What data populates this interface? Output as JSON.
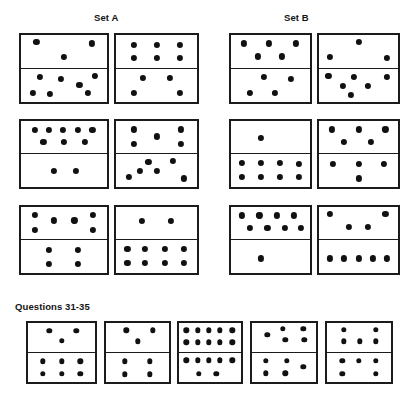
{
  "labels": {
    "set_a": "Set A",
    "set_b": "Set B",
    "questions": "Questions 31-35"
  },
  "style": {
    "pip_color": "#111111",
    "border_color": "#1b1b1b",
    "tile_fill": "#ffffff",
    "text_color": "#141414"
  },
  "puzzle_type": "domino-sequence",
  "dominoes": [
    {
      "id": "A1",
      "group": "Set A",
      "row": 1,
      "col": 1,
      "x": 19,
      "y": 33,
      "w": 90,
      "h": 71,
      "top_count": 3,
      "bottom_count": 7,
      "top_pips": [
        [
          18,
          22
        ],
        [
          82,
          26
        ],
        [
          50,
          68
        ]
      ],
      "bottom_pips": [
        [
          22,
          24
        ],
        [
          46,
          32
        ],
        [
          68,
          50
        ],
        [
          86,
          22
        ],
        [
          14,
          72
        ],
        [
          34,
          76
        ],
        [
          78,
          74
        ]
      ]
    },
    {
      "id": "A2",
      "group": "Set A",
      "row": 1,
      "col": 2,
      "x": 114,
      "y": 33,
      "w": 85,
      "h": 71,
      "top_count": 6,
      "bottom_count": 4,
      "top_pips": [
        [
          22,
          30
        ],
        [
          50,
          30
        ],
        [
          79,
          30
        ],
        [
          22,
          70
        ],
        [
          50,
          70
        ],
        [
          79,
          70
        ]
      ],
      "bottom_pips": [
        [
          33,
          28
        ],
        [
          67,
          28
        ],
        [
          22,
          72
        ],
        [
          79,
          72
        ]
      ]
    },
    {
      "id": "A3",
      "group": "Set A",
      "row": 2,
      "col": 1,
      "x": 19,
      "y": 119,
      "w": 90,
      "h": 70,
      "top_count": 8,
      "bottom_count": 2,
      "top_pips": [
        [
          16,
          28
        ],
        [
          32,
          28
        ],
        [
          49,
          28
        ],
        [
          66,
          28
        ],
        [
          83,
          28
        ],
        [
          26,
          66
        ],
        [
          50,
          66
        ],
        [
          74,
          66
        ]
      ],
      "bottom_pips": [
        [
          38,
          50
        ],
        [
          64,
          50
        ]
      ]
    },
    {
      "id": "A4",
      "group": "Set A",
      "row": 2,
      "col": 2,
      "x": 114,
      "y": 119,
      "w": 85,
      "h": 70,
      "top_count": 5,
      "bottom_count": 6,
      "top_pips": [
        [
          22,
          26
        ],
        [
          80,
          26
        ],
        [
          50,
          48
        ],
        [
          22,
          72
        ],
        [
          80,
          72
        ]
      ],
      "bottom_pips": [
        [
          40,
          24
        ],
        [
          70,
          22
        ],
        [
          16,
          70
        ],
        [
          50,
          52
        ],
        [
          84,
          74
        ],
        [
          30,
          52
        ]
      ]
    },
    {
      "id": "A5",
      "group": "Set A",
      "row": 3,
      "col": 1,
      "x": 19,
      "y": 205,
      "w": 90,
      "h": 70,
      "top_count": 6,
      "bottom_count": 4,
      "top_pips": [
        [
          16,
          24
        ],
        [
          38,
          42
        ],
        [
          62,
          42
        ],
        [
          84,
          24
        ],
        [
          16,
          72
        ],
        [
          84,
          72
        ]
      ],
      "bottom_pips": [
        [
          32,
          30
        ],
        [
          66,
          30
        ],
        [
          32,
          72
        ],
        [
          66,
          72
        ]
      ]
    },
    {
      "id": "A6",
      "group": "Set A",
      "row": 3,
      "col": 2,
      "x": 114,
      "y": 205,
      "w": 85,
      "h": 70,
      "top_count": 2,
      "bottom_count": 8,
      "top_pips": [
        [
          32,
          44
        ],
        [
          68,
          44
        ]
      ],
      "bottom_pips": [
        [
          14,
          28
        ],
        [
          36,
          28
        ],
        [
          60,
          28
        ],
        [
          84,
          28
        ],
        [
          14,
          70
        ],
        [
          36,
          70
        ],
        [
          60,
          70
        ],
        [
          84,
          70
        ]
      ]
    },
    {
      "id": "B1",
      "group": "Set B",
      "row": 1,
      "col": 1,
      "x": 229,
      "y": 33,
      "w": 83,
      "h": 71,
      "top_count": 5,
      "bottom_count": 4,
      "top_pips": [
        [
          16,
          26
        ],
        [
          48,
          26
        ],
        [
          82,
          26
        ],
        [
          34,
          66
        ],
        [
          64,
          66
        ]
      ],
      "bottom_pips": [
        [
          42,
          26
        ],
        [
          76,
          30
        ],
        [
          24,
          72
        ],
        [
          56,
          74
        ]
      ]
    },
    {
      "id": "B2",
      "group": "Set B",
      "row": 1,
      "col": 2,
      "x": 317,
      "y": 33,
      "w": 83,
      "h": 71,
      "top_count": 3,
      "bottom_count": 6,
      "top_pips": [
        [
          50,
          22
        ],
        [
          14,
          68
        ],
        [
          86,
          70
        ]
      ],
      "bottom_pips": [
        [
          12,
          22
        ],
        [
          44,
          26
        ],
        [
          86,
          24
        ],
        [
          30,
          52
        ],
        [
          62,
          52
        ],
        [
          40,
          78
        ]
      ]
    },
    {
      "id": "B3",
      "group": "Set B",
      "row": 2,
      "col": 1,
      "x": 229,
      "y": 119,
      "w": 83,
      "h": 70,
      "top_count": 1,
      "bottom_count": 8,
      "top_pips": [
        [
          38,
          52
        ]
      ],
      "bottom_pips": [
        [
          14,
          28
        ],
        [
          38,
          28
        ],
        [
          62,
          28
        ],
        [
          86,
          30
        ],
        [
          14,
          70
        ],
        [
          38,
          70
        ],
        [
          62,
          70
        ],
        [
          86,
          70
        ]
      ]
    },
    {
      "id": "B4",
      "group": "Set B",
      "row": 2,
      "col": 2,
      "x": 317,
      "y": 119,
      "w": 83,
      "h": 70,
      "top_count": 5,
      "bottom_count": 4,
      "top_pips": [
        [
          16,
          26
        ],
        [
          50,
          26
        ],
        [
          84,
          26
        ],
        [
          32,
          66
        ],
        [
          66,
          66
        ]
      ],
      "bottom_pips": [
        [
          18,
          30
        ],
        [
          50,
          30
        ],
        [
          82,
          30
        ],
        [
          50,
          74
        ]
      ]
    },
    {
      "id": "B5",
      "group": "Set B",
      "row": 3,
      "col": 1,
      "x": 229,
      "y": 205,
      "w": 83,
      "h": 70,
      "top_count": 8,
      "bottom_count": 1,
      "top_pips": [
        [
          14,
          26
        ],
        [
          36,
          26
        ],
        [
          58,
          26
        ],
        [
          80,
          26
        ],
        [
          24,
          66
        ],
        [
          46,
          66
        ],
        [
          68,
          66
        ],
        [
          88,
          66
        ]
      ],
      "bottom_pips": [
        [
          38,
          56
        ]
      ]
    },
    {
      "id": "B6",
      "group": "Set B",
      "row": 3,
      "col": 2,
      "x": 317,
      "y": 205,
      "w": 83,
      "h": 70,
      "top_count": 4,
      "bottom_count": 5,
      "top_pips": [
        [
          14,
          22
        ],
        [
          84,
          22
        ],
        [
          38,
          62
        ],
        [
          62,
          62
        ]
      ],
      "bottom_pips": [
        [
          14,
          56
        ],
        [
          32,
          56
        ],
        [
          50,
          56
        ],
        [
          68,
          56
        ],
        [
          86,
          56
        ]
      ]
    }
  ],
  "question_dominoes": [
    {
      "id": "Q31",
      "index": 31,
      "x": 26,
      "y": 321,
      "w": 71,
      "h": 63,
      "top_count": 3,
      "bottom_count": 6,
      "top_pips": [
        [
          32,
          28
        ],
        [
          72,
          28
        ],
        [
          50,
          62
        ]
      ],
      "bottom_pips": [
        [
          22,
          30
        ],
        [
          50,
          30
        ],
        [
          78,
          30
        ],
        [
          22,
          72
        ],
        [
          50,
          72
        ],
        [
          78,
          72
        ]
      ]
    },
    {
      "id": "Q32",
      "index": 32,
      "x": 104,
      "y": 321,
      "w": 67,
      "h": 63,
      "top_count": 3,
      "bottom_count": 4,
      "top_pips": [
        [
          32,
          26
        ],
        [
          74,
          26
        ],
        [
          50,
          64
        ]
      ],
      "bottom_pips": [
        [
          30,
          30
        ],
        [
          70,
          30
        ],
        [
          30,
          74
        ],
        [
          70,
          74
        ]
      ]
    },
    {
      "id": "Q33",
      "index": 33,
      "x": 177,
      "y": 321,
      "w": 66,
      "h": 63,
      "top_count": 10,
      "bottom_count": 7,
      "top_pips": [
        [
          12,
          26
        ],
        [
          30,
          26
        ],
        [
          48,
          26
        ],
        [
          66,
          26
        ],
        [
          86,
          26
        ],
        [
          12,
          68
        ],
        [
          30,
          68
        ],
        [
          48,
          68
        ],
        [
          66,
          68
        ],
        [
          86,
          68
        ]
      ],
      "bottom_pips": [
        [
          12,
          26
        ],
        [
          30,
          26
        ],
        [
          48,
          26
        ],
        [
          66,
          26
        ],
        [
          86,
          26
        ],
        [
          32,
          72
        ],
        [
          60,
          72
        ]
      ]
    },
    {
      "id": "Q34",
      "index": 34,
      "x": 250,
      "y": 321,
      "w": 68,
      "h": 63,
      "top_count": 5,
      "bottom_count": 5,
      "top_pips": [
        [
          48,
          20
        ],
        [
          80,
          20
        ],
        [
          24,
          42
        ],
        [
          52,
          58
        ],
        [
          82,
          60
        ]
      ],
      "bottom_pips": [
        [
          22,
          28
        ],
        [
          54,
          28
        ],
        [
          80,
          48
        ],
        [
          22,
          70
        ],
        [
          52,
          70
        ]
      ]
    },
    {
      "id": "Q35",
      "index": 35,
      "x": 325,
      "y": 321,
      "w": 68,
      "h": 63,
      "top_count": 5,
      "bottom_count": 5,
      "top_pips": [
        [
          26,
          24
        ],
        [
          76,
          24
        ],
        [
          26,
          64
        ],
        [
          51,
          64
        ],
        [
          76,
          64
        ]
      ],
      "bottom_pips": [
        [
          24,
          28
        ],
        [
          50,
          28
        ],
        [
          76,
          28
        ],
        [
          24,
          72
        ],
        [
          76,
          72
        ]
      ]
    }
  ]
}
